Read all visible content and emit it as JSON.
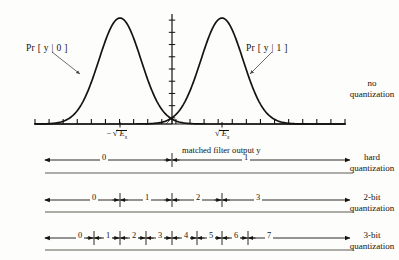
{
  "figure": {
    "type": "diagram"
  },
  "curves": {
    "left_label": "Pr [ y | 0 ]",
    "right_label": "Pr [ y | 1 ]",
    "left_mean_x": 120,
    "right_mean_x": 222,
    "sigma": 21,
    "peak_y": 18,
    "baseline_y": 124
  },
  "axis": {
    "x_start": 35,
    "x_end": 345,
    "y": 124,
    "tick_count": 23,
    "tick_height": 5,
    "vertical_axis_x": 172,
    "vertical_axis_top": 14,
    "vertical_tick_count": 9,
    "left_marker_label": "E",
    "left_marker_sign": "−",
    "left_marker_sub": "s",
    "right_marker_label": "E",
    "right_marker_sub": "s",
    "left_marker_x": 120,
    "right_marker_x": 222,
    "output_label": "matched filter output y"
  },
  "hatch": {
    "left_x": 145,
    "right_x": 172,
    "top_y": 68,
    "bottom_y": 124,
    "spacing": 5
  },
  "side_labels": [
    {
      "line1": "no",
      "line2": "quantization"
    },
    {
      "line1": "hard",
      "line2": "quantization"
    },
    {
      "line1": "2-bit",
      "line2": "quantization"
    },
    {
      "line1": "3-bit",
      "line2": "quantization"
    }
  ],
  "bands": [
    {
      "name": "hard-quantization",
      "axis_y": 160,
      "rule_y": 173,
      "label_y": 148,
      "boundaries": [
        172
      ],
      "regions": [
        "0",
        "1"
      ],
      "region_centers": [
        103,
        245
      ]
    },
    {
      "name": "2-bit-quantization",
      "axis_y": 200,
      "rule_y": 212,
      "label_y": 188,
      "boundaries": [
        120,
        172,
        222
      ],
      "regions": [
        "0",
        "1",
        "2",
        "3"
      ],
      "region_centers": [
        93,
        146,
        197,
        257
      ]
    },
    {
      "name": "3-bit-quantization",
      "axis_y": 238,
      "rule_y": 250,
      "label_y": 226,
      "boundaries": [
        94,
        120,
        146,
        172,
        197,
        222,
        248
      ],
      "regions": [
        "0",
        "1",
        "2",
        "3",
        "4",
        "5",
        "6",
        "7"
      ],
      "region_centers": [
        79,
        107,
        133,
        159,
        185,
        210,
        235,
        268
      ]
    }
  ],
  "colors": {
    "ink": "#15130f",
    "rule": "#4a4740",
    "background": "#fdfdfc"
  }
}
